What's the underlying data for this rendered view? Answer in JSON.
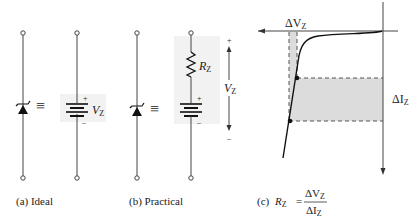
{
  "figure": {
    "panels": [
      {
        "id": "a",
        "caption": "(a) Ideal",
        "battery_label": "V",
        "battery_label_sub": "Z",
        "plus": "+",
        "minus": "–",
        "equiv": "≡"
      },
      {
        "id": "b",
        "caption": "(b) Practical",
        "resistor_label": "R",
        "resistor_label_sub": "Z",
        "voltage_label": "V",
        "voltage_label_sub": "Z",
        "plus": "+",
        "minus": "–",
        "span_plus": "+",
        "span_minus": "–",
        "equiv": "≡"
      },
      {
        "id": "c",
        "caption_prefix": "(c)",
        "formula_lhs": "R",
        "formula_lhs_sub": "Z",
        "equals": "=",
        "numerator": "ΔV",
        "numerator_sub": "Z",
        "denominator": "ΔI",
        "denominator_sub": "Z",
        "delta_v_label": "ΔV",
        "delta_v_sub": "Z",
        "delta_i_label": "ΔI",
        "delta_i_sub": "Z"
      }
    ],
    "colors": {
      "line": "#333333",
      "shade": "#d9d9d9",
      "dash": "#555555"
    }
  }
}
